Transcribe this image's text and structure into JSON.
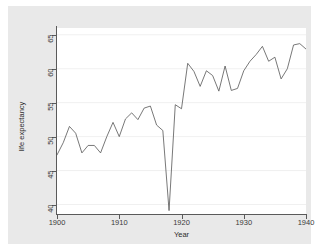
{
  "chart_data": {
    "type": "line",
    "title": "",
    "xlabel": "Year",
    "ylabel": "life expectancy",
    "xlim": [
      1900,
      1940
    ],
    "ylim": [
      38.6,
      66.0
    ],
    "xticks": [
      1900,
      1910,
      1920,
      1930,
      1940
    ],
    "xtick_labels": [
      "1900",
      "1910",
      "1920",
      "1930",
      "1940"
    ],
    "yticks": [
      40,
      45,
      50,
      55,
      60,
      65
    ],
    "ytick_labels": [
      "40",
      "45",
      "50",
      "55",
      "60",
      "65"
    ],
    "grid": "horizontal",
    "legend": "none",
    "series": [
      {
        "name": "life expectancy",
        "color": "#555555",
        "x": [
          1900,
          1901,
          1902,
          1903,
          1904,
          1905,
          1906,
          1907,
          1908,
          1909,
          1910,
          1911,
          1912,
          1913,
          1914,
          1915,
          1916,
          1917,
          1918,
          1919,
          1920,
          1921,
          1922,
          1923,
          1924,
          1925,
          1926,
          1927,
          1928,
          1929,
          1930,
          1931,
          1932,
          1933,
          1934,
          1935,
          1936,
          1937,
          1938,
          1939,
          1940
        ],
        "values": [
          47.3,
          49.1,
          51.5,
          50.5,
          47.6,
          48.7,
          48.7,
          47.6,
          50.0,
          52.1,
          50.0,
          52.6,
          53.5,
          52.5,
          54.2,
          54.5,
          51.7,
          50.9,
          39.1,
          54.7,
          54.1,
          60.8,
          59.6,
          57.4,
          59.7,
          59.0,
          56.7,
          60.4,
          56.8,
          57.1,
          59.7,
          61.1,
          62.1,
          63.3,
          61.1,
          61.7,
          58.5,
          60.0,
          63.5,
          63.7,
          62.9
        ]
      }
    ]
  },
  "axis": {
    "x_title": "Year",
    "y_title": "life expectancy"
  },
  "style": {
    "line_color": "#555555",
    "grid_color": "#eeeeee",
    "plot_bg": "#ffffff",
    "region_bg": "#e9e9e9",
    "page_bg": "#ffffff",
    "axis_color": "#5a5a5a"
  }
}
